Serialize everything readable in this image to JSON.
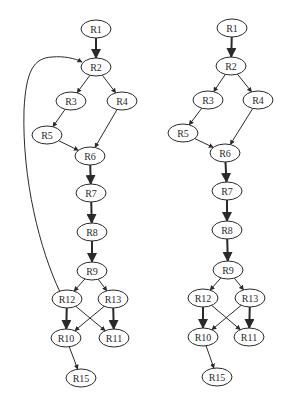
{
  "graphs": [
    {
      "id": "left",
      "nodes": [
        {
          "id": "R1",
          "label": "R1",
          "x": 96,
          "y": 29
        },
        {
          "id": "R2",
          "label": "R2",
          "x": 96,
          "y": 67
        },
        {
          "id": "R3",
          "label": "R3",
          "x": 71,
          "y": 101
        },
        {
          "id": "R4",
          "label": "R4",
          "x": 122,
          "y": 101
        },
        {
          "id": "R5",
          "label": "R5",
          "x": 47,
          "y": 135
        },
        {
          "id": "R6",
          "label": "R6",
          "x": 90,
          "y": 156
        },
        {
          "id": "R7",
          "label": "R7",
          "x": 91,
          "y": 193
        },
        {
          "id": "R8",
          "label": "R8",
          "x": 92,
          "y": 232
        },
        {
          "id": "R9",
          "label": "R9",
          "x": 92,
          "y": 271
        },
        {
          "id": "R12",
          "label": "R12",
          "x": 67,
          "y": 299
        },
        {
          "id": "R13",
          "label": "R13",
          "x": 113,
          "y": 299
        },
        {
          "id": "R10",
          "label": "R10",
          "x": 66,
          "y": 338
        },
        {
          "id": "R11",
          "label": "R11",
          "x": 114,
          "y": 338
        },
        {
          "id": "R15",
          "label": "R15",
          "x": 81,
          "y": 378
        }
      ],
      "edges": [
        {
          "from": "R1",
          "to": "R2",
          "weight": "bold"
        },
        {
          "from": "R2",
          "to": "R3",
          "weight": "thin"
        },
        {
          "from": "R2",
          "to": "R4",
          "weight": "thin"
        },
        {
          "from": "R3",
          "to": "R5",
          "weight": "thin"
        },
        {
          "from": "R5",
          "to": "R6",
          "weight": "thin"
        },
        {
          "from": "R4",
          "to": "R6",
          "weight": "thin"
        },
        {
          "from": "R6",
          "to": "R7",
          "weight": "bold"
        },
        {
          "from": "R7",
          "to": "R8",
          "weight": "bold"
        },
        {
          "from": "R8",
          "to": "R9",
          "weight": "bold"
        },
        {
          "from": "R9",
          "to": "R12",
          "weight": "thin"
        },
        {
          "from": "R9",
          "to": "R13",
          "weight": "thin"
        },
        {
          "from": "R12",
          "to": "R10",
          "weight": "bold"
        },
        {
          "from": "R12",
          "to": "R11",
          "weight": "thin"
        },
        {
          "from": "R13",
          "to": "R10",
          "weight": "thin"
        },
        {
          "from": "R13",
          "to": "R11",
          "weight": "bold"
        },
        {
          "from": "R10",
          "to": "R15",
          "weight": "thin"
        },
        {
          "from": "R12",
          "to": "R2",
          "weight": "thin",
          "curved": true
        }
      ]
    },
    {
      "id": "right",
      "nodes": [
        {
          "id": "R1",
          "label": "R1",
          "x": 232,
          "y": 28
        },
        {
          "id": "R2",
          "label": "R2",
          "x": 231,
          "y": 66
        },
        {
          "id": "R3",
          "label": "R3",
          "x": 208,
          "y": 100
        },
        {
          "id": "R4",
          "label": "R4",
          "x": 258,
          "y": 100
        },
        {
          "id": "R5",
          "label": "R5",
          "x": 183,
          "y": 133
        },
        {
          "id": "R6",
          "label": "R6",
          "x": 225,
          "y": 153
        },
        {
          "id": "R7",
          "label": "R7",
          "x": 227,
          "y": 191
        },
        {
          "id": "R8",
          "label": "R8",
          "x": 227,
          "y": 230
        },
        {
          "id": "R9",
          "label": "R9",
          "x": 228,
          "y": 270
        },
        {
          "id": "R12",
          "label": "R12",
          "x": 203,
          "y": 298
        },
        {
          "id": "R13",
          "label": "R13",
          "x": 250,
          "y": 298
        },
        {
          "id": "R10",
          "label": "R10",
          "x": 203,
          "y": 337
        },
        {
          "id": "R11",
          "label": "R11",
          "x": 249,
          "y": 337
        },
        {
          "id": "R15",
          "label": "R15",
          "x": 217,
          "y": 377
        }
      ],
      "edges": [
        {
          "from": "R1",
          "to": "R2",
          "weight": "bold"
        },
        {
          "from": "R2",
          "to": "R3",
          "weight": "thin"
        },
        {
          "from": "R2",
          "to": "R4",
          "weight": "thin"
        },
        {
          "from": "R3",
          "to": "R5",
          "weight": "thin"
        },
        {
          "from": "R5",
          "to": "R6",
          "weight": "thin"
        },
        {
          "from": "R4",
          "to": "R6",
          "weight": "thin"
        },
        {
          "from": "R6",
          "to": "R7",
          "weight": "bold"
        },
        {
          "from": "R7",
          "to": "R8",
          "weight": "bold"
        },
        {
          "from": "R8",
          "to": "R9",
          "weight": "bold"
        },
        {
          "from": "R9",
          "to": "R12",
          "weight": "thin"
        },
        {
          "from": "R9",
          "to": "R13",
          "weight": "thin"
        },
        {
          "from": "R12",
          "to": "R10",
          "weight": "bold"
        },
        {
          "from": "R12",
          "to": "R11",
          "weight": "thin"
        },
        {
          "from": "R13",
          "to": "R10",
          "weight": "thin"
        },
        {
          "from": "R13",
          "to": "R11",
          "weight": "bold"
        },
        {
          "from": "R10",
          "to": "R15",
          "weight": "thin"
        }
      ]
    }
  ],
  "style": {
    "node_rx": 15,
    "node_ry": 9,
    "stroke_color": "#2a2a2a",
    "background": "#ffffff"
  },
  "back_edge_path": "M 60 292 C 40 250, 22 180, 24 110 C 26 70, 34 58, 52 57 C 64 56, 74 58, 82 62"
}
